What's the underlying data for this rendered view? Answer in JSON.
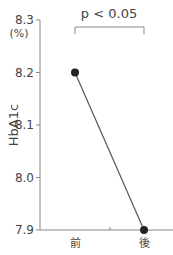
{
  "chart_data": {
    "type": "line",
    "title": "",
    "xlabel": "",
    "ylabel": "HbA1c",
    "yunit": "(%)",
    "categories": [
      "前",
      "後"
    ],
    "series": [
      {
        "name": "HbA1c",
        "values": [
          8.2,
          7.9
        ]
      }
    ],
    "ylim": [
      7.9,
      8.3
    ],
    "yticks": [
      7.9,
      8.0,
      8.1,
      8.2,
      8.3
    ],
    "ytick_labels": [
      "7.9",
      "8.0",
      "8.1",
      "8.2",
      "8.3"
    ],
    "grid": false,
    "legend": null,
    "annotations": [
      {
        "type": "significance-bracket",
        "text": "p < 0.05",
        "between": [
          "前",
          "後"
        ]
      }
    ]
  },
  "colors": {
    "axis": "#888888",
    "line": "#555555",
    "marker": "#222222",
    "text": "#444444"
  }
}
